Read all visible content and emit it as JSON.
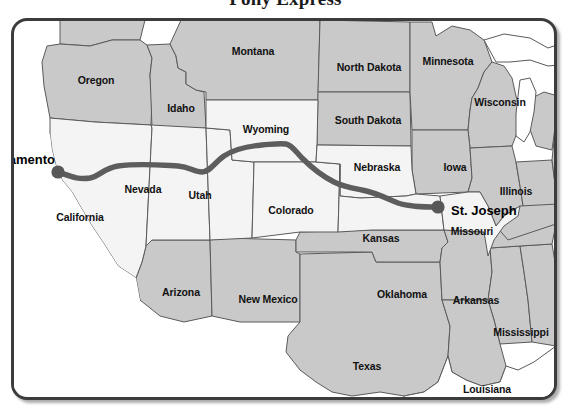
{
  "title": "Pony Express",
  "colors": {
    "frame_border": "#3c3c3c",
    "state_light": "#f4f4f4",
    "state_shaded": "#c9c9c9",
    "state_outline": "#5a5a5a",
    "route_line": "#5d5d5d",
    "city_dot": "#585858",
    "water": "#ffffff",
    "label_text": "#111111",
    "background": "#ffffff"
  },
  "map": {
    "route_name": "Pony Express Route",
    "route_endpoints": [
      "Sacramento",
      "St. Joseph"
    ],
    "cities": [
      {
        "name": "Sacramento",
        "x": 58,
        "y": 172,
        "label_side": "left",
        "label_x": 52,
        "label_y": 156
      },
      {
        "name": "St. Joseph",
        "x": 438,
        "y": 207,
        "label_side": "right",
        "label_x": 448,
        "label_y": 207
      }
    ],
    "states": [
      {
        "name": "Oregon",
        "x": 93,
        "y": 77,
        "shaded": true
      },
      {
        "name": "Idaho",
        "x": 178,
        "y": 105,
        "shaded": true
      },
      {
        "name": "Montana",
        "x": 250,
        "y": 48,
        "shaded": true
      },
      {
        "name": "North Dakota",
        "x": 366,
        "y": 64,
        "shaded": true
      },
      {
        "name": "South Dakota",
        "x": 365,
        "y": 117,
        "shaded": true
      },
      {
        "name": "Minnesota",
        "x": 445,
        "y": 58,
        "shaded": true
      },
      {
        "name": "Wisconsin",
        "x": 497,
        "y": 99,
        "shaded": true
      },
      {
        "name": "Wyoming",
        "x": 263,
        "y": 126,
        "shaded": false
      },
      {
        "name": "Nebraska",
        "x": 374,
        "y": 164,
        "shaded": false
      },
      {
        "name": "Iowa",
        "x": 452,
        "y": 164,
        "shaded": true
      },
      {
        "name": "Illinois",
        "x": 513,
        "y": 188,
        "shaded": true
      },
      {
        "name": "Nevada",
        "x": 140,
        "y": 186,
        "shaded": false
      },
      {
        "name": "Utah",
        "x": 197,
        "y": 192,
        "shaded": false
      },
      {
        "name": "Colorado",
        "x": 288,
        "y": 207,
        "shaded": false
      },
      {
        "name": "California",
        "x": 77,
        "y": 214,
        "shaded": false
      },
      {
        "name": "Missouri",
        "x": 469,
        "y": 228,
        "shaded": false
      },
      {
        "name": "Kansas",
        "x": 378,
        "y": 235,
        "shaded": false
      },
      {
        "name": "Arizona",
        "x": 178,
        "y": 289,
        "shaded": true
      },
      {
        "name": "New Mexico",
        "x": 265,
        "y": 296,
        "shaded": true
      },
      {
        "name": "Oklahoma",
        "x": 399,
        "y": 291,
        "shaded": true
      },
      {
        "name": "Arkansas",
        "x": 473,
        "y": 297,
        "shaded": true
      },
      {
        "name": "Mississippi",
        "x": 518,
        "y": 329,
        "shaded": true
      },
      {
        "name": "Texas",
        "x": 364,
        "y": 363,
        "shaded": true
      },
      {
        "name": "Louisiana",
        "x": 484,
        "y": 386,
        "shaded": true
      }
    ]
  }
}
